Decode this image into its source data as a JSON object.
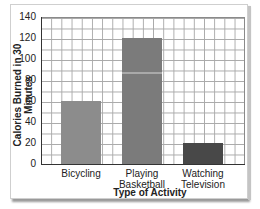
{
  "chart_data": {
    "type": "bar",
    "title": "",
    "xlabel": "Type of Activity",
    "ylabel": "Calories Burned in 30 Minutes",
    "categories": [
      "Bicycling",
      "Playing Basketball",
      "Watching Television"
    ],
    "category_lines": [
      [
        "Bicycling"
      ],
      [
        "Playing",
        "Basketball"
      ],
      [
        "Watching",
        "Television"
      ]
    ],
    "values": [
      60,
      120,
      20
    ],
    "ylim": [
      0,
      140
    ],
    "yticks": [
      0,
      20,
      40,
      60,
      80,
      100,
      120,
      140
    ],
    "grid": true,
    "legend": null,
    "colors": [
      "#8c8c8c",
      "#7b7b7b",
      "#484848"
    ]
  },
  "labels": {
    "ylabel": "Calories Burned in 30 Minutes",
    "xlabel": "Type of Activity",
    "yticks": [
      "0",
      "20",
      "40",
      "60",
      "80",
      "100",
      "120",
      "140"
    ],
    "cat0_l1": "Bicycling",
    "cat1_l1": "Playing",
    "cat1_l2": "Basketball",
    "cat2_l1": "Watching",
    "cat2_l2": "Television"
  }
}
